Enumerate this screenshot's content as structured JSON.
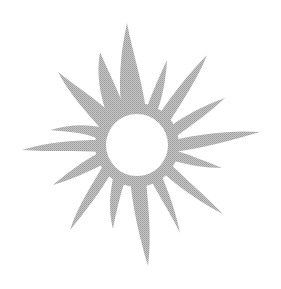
{
  "image": {
    "subject": "sun clipart",
    "alt_text": "Gray halftone sun with wavy flame-like rays",
    "colors": {
      "background": "#ffffff",
      "ray_fill": "#b4b4b4",
      "halftone_dot": "#9a9a9a",
      "center_fill": "#ffffff"
    },
    "center": {
      "cx": 137,
      "cy": 145,
      "r": 31
    },
    "ray_count": 16
  }
}
